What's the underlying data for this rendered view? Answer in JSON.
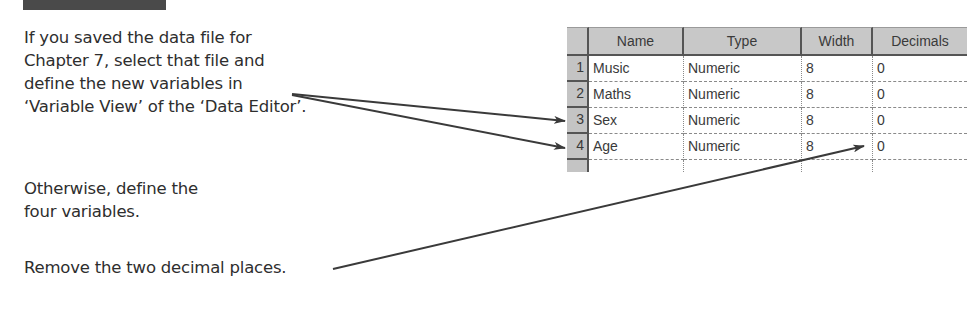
{
  "instructions": {
    "block1": [
      "If you saved the data file for",
      "Chapter 7, select that file and",
      "define the new variables in",
      "‘Variable View’ of the ‘Data Editor’."
    ],
    "block2": [
      "Otherwise, define the",
      "four variables."
    ],
    "block3": [
      "Remove the two decimal places."
    ]
  },
  "variable_view": {
    "columns": [
      "Name",
      "Type",
      "Width",
      "Decimals"
    ],
    "rows": [
      {
        "num": "1",
        "name": "Music",
        "type": "Numeric",
        "width": "8",
        "decimals": "0"
      },
      {
        "num": "2",
        "name": "Maths",
        "type": "Numeric",
        "width": "8",
        "decimals": "0"
      },
      {
        "num": "3",
        "name": "Sex",
        "type": "Numeric",
        "width": "8",
        "decimals": "0"
      },
      {
        "num": "4",
        "name": "Age",
        "type": "Numeric",
        "width": "8",
        "decimals": "0"
      }
    ]
  },
  "colors": {
    "header_bar": "#4a4a4a",
    "grid_header": "#c8c8c8",
    "arrow": "#3a3a3a"
  }
}
